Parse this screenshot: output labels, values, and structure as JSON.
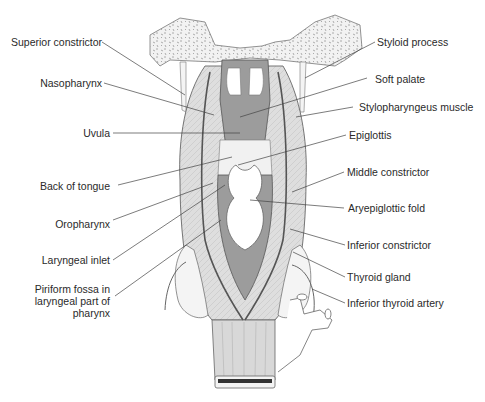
{
  "figure": {
    "left_labels": [
      {
        "text": "Superior constrictor"
      },
      {
        "text": "Nasopharynx"
      },
      {
        "text": "Uvula"
      },
      {
        "text": "Back of tongue"
      },
      {
        "text": "Oropharynx"
      },
      {
        "text": "Laryngeal inlet"
      },
      {
        "line1": "Piriform fossa in",
        "line2": "laryngeal part of",
        "line3": "pharynx"
      }
    ],
    "right_labels": [
      {
        "text": "Styloid process"
      },
      {
        "text": "Soft palate"
      },
      {
        "text": "Stylopharyngeus muscle"
      },
      {
        "text": "Epiglottis"
      },
      {
        "text": "Middle constrictor"
      },
      {
        "text": "Aryepiglottic fold"
      },
      {
        "text": "Inferior constrictor"
      },
      {
        "text": "Thyroid gland"
      },
      {
        "text": "Inferior thyroid artery"
      }
    ],
    "colors": {
      "mucosa": "#9a9a9a",
      "muscle": "#dcdcdc",
      "bone": "#efefef",
      "outline": "#555555",
      "leader": "#444444"
    }
  }
}
